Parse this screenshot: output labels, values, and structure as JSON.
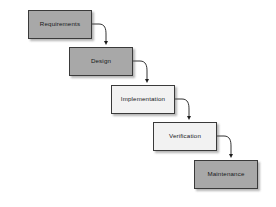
{
  "diagram": {
    "canvas": {
      "width": 276,
      "height": 207,
      "background": "#ffffff"
    },
    "style": {
      "border_color": "#3a3a3a",
      "connector_color": "#1c1c1c",
      "shadow_color": "#8a8a8a",
      "fill_dark": "#a8a8a8",
      "fill_light": "#f2f2f2"
    },
    "phases": [
      {
        "id": "requirements",
        "label": "Requirements",
        "fill": "#a8a8a8",
        "x": 28,
        "y": 10,
        "w": 64,
        "h": 29
      },
      {
        "id": "design",
        "label": "Design",
        "fill": "#a8a8a8",
        "x": 69,
        "y": 47,
        "w": 64,
        "h": 29
      },
      {
        "id": "implementation",
        "label": "Implementation",
        "fill": "#f2f2f2",
        "x": 111,
        "y": 85,
        "w": 64,
        "h": 29
      },
      {
        "id": "verification",
        "label": "Verification",
        "fill": "#f2f2f2",
        "x": 153,
        "y": 122,
        "w": 64,
        "h": 29
      },
      {
        "id": "maintenance",
        "label": "Maintenance",
        "fill": "#a8a8a8",
        "x": 194,
        "y": 160,
        "w": 64,
        "h": 29
      }
    ],
    "connectors": [
      {
        "id": "requirements-to-design",
        "from": "requirements",
        "to": "design",
        "path": "M 92 24 L 99 24 C 105 24 106 29 106 34 L 106 43"
      },
      {
        "id": "design-to-implementation",
        "from": "design",
        "to": "implementation",
        "path": "M 133 61 L 140 61 C 146 61 147 66 147 71 L 147 81"
      },
      {
        "id": "implementation-to-verification",
        "from": "implementation",
        "to": "verification",
        "path": "M 175 99 L 182 99 C 188 99 189 104 189 109 L 189 118"
      },
      {
        "id": "verification-to-maintenance",
        "from": "verification",
        "to": "maintenance",
        "path": "M 217 136 L 224 136 C 230 136 231 141 231 146 L 231 156"
      }
    ]
  }
}
